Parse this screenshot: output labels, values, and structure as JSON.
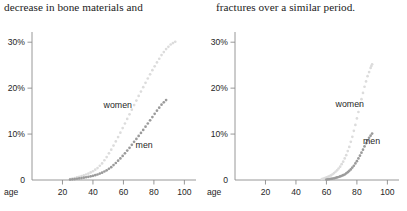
{
  "captions": {
    "left": "decrease in bone materials and",
    "right": "fractures over a similar period."
  },
  "colors": {
    "women_series": "#dcdcdc",
    "men_series": "#9b9b9b",
    "axis": "#8c8c8c",
    "text": "#262626",
    "background": "#ffffff"
  },
  "chart_data": [
    {
      "type": "scatter",
      "id": "left",
      "title": "",
      "xlabel": "age",
      "ylabel": "",
      "xlim": [
        0,
        105
      ],
      "ylim": [
        0,
        32
      ],
      "grid": false,
      "legend_position": "inline-annotation",
      "xticks": [
        20,
        40,
        60,
        80,
        100
      ],
      "xtick_labels": [
        "20",
        "40",
        "60",
        "80",
        "100"
      ],
      "yticks": [
        0,
        10,
        20,
        30
      ],
      "ytick_labels": [
        "0",
        "10%",
        "20%",
        "30%"
      ],
      "series": [
        {
          "name": "women",
          "color": "#dcdcdc",
          "x": [
            25,
            28,
            31,
            34,
            37,
            40,
            43,
            46,
            49,
            52,
            55,
            58,
            61,
            64,
            67,
            70,
            73,
            76,
            79,
            82,
            85,
            88,
            91,
            94
          ],
          "values": [
            0.2,
            0.4,
            0.7,
            1.0,
            1.4,
            1.9,
            2.6,
            3.6,
            5.0,
            6.6,
            8.4,
            10.3,
            12.3,
            14.3,
            16.3,
            18.3,
            20.2,
            22.1,
            23.9,
            25.6,
            27.2,
            28.5,
            29.5,
            30.1
          ]
        },
        {
          "name": "men",
          "color": "#9b9b9b",
          "x": [
            25,
            28,
            31,
            34,
            37,
            40,
            43,
            46,
            49,
            52,
            55,
            58,
            61,
            64,
            67,
            70,
            73,
            76,
            79,
            82,
            85,
            88
          ],
          "values": [
            0.1,
            0.2,
            0.35,
            0.5,
            0.7,
            0.9,
            1.2,
            1.6,
            2.1,
            2.8,
            3.7,
            4.7,
            5.8,
            7.0,
            8.3,
            9.6,
            10.9,
            12.3,
            13.7,
            15.1,
            16.4,
            17.4
          ]
        }
      ],
      "annotations": [
        {
          "text": "women",
          "x": 47,
          "y": 16.2
        },
        {
          "text": "men",
          "x": 68,
          "y": 7.3
        }
      ]
    },
    {
      "type": "scatter",
      "id": "right",
      "title": "",
      "xlabel": "age",
      "ylabel": "",
      "xlim": [
        0,
        105
      ],
      "ylim": [
        0,
        32
      ],
      "grid": false,
      "legend_position": "inline-annotation",
      "xticks": [
        20,
        40,
        60,
        80,
        100
      ],
      "xtick_labels": [
        "20",
        "40",
        "60",
        "80",
        "100"
      ],
      "yticks": [
        0,
        10,
        20,
        30
      ],
      "ytick_labels": [
        "0",
        "10%",
        "20%",
        "30%"
      ],
      "series": [
        {
          "name": "women",
          "color": "#dcdcdc",
          "x": [
            57,
            59,
            61,
            63,
            65,
            67,
            69,
            71,
            73,
            75,
            77,
            79,
            81,
            83,
            85,
            87,
            89,
            90
          ],
          "values": [
            0.2,
            0.4,
            0.7,
            1.0,
            1.5,
            2.1,
            2.9,
            4.0,
            5.4,
            7.2,
            9.4,
            12.0,
            14.8,
            17.6,
            20.3,
            22.6,
            24.4,
            25.2
          ]
        },
        {
          "name": "men",
          "color": "#9b9b9b",
          "x": [
            60,
            62,
            64,
            66,
            68,
            70,
            72,
            74,
            76,
            78,
            80,
            82,
            84,
            86,
            88,
            90
          ],
          "values": [
            0.1,
            0.2,
            0.3,
            0.45,
            0.65,
            0.9,
            1.2,
            1.7,
            2.3,
            3.1,
            4.1,
            5.3,
            6.6,
            8.0,
            9.2,
            10.1
          ]
        }
      ],
      "annotations": [
        {
          "text": "women",
          "x": 66,
          "y": 16.4
        },
        {
          "text": "men",
          "x": 84,
          "y": 8.2
        }
      ]
    }
  ]
}
